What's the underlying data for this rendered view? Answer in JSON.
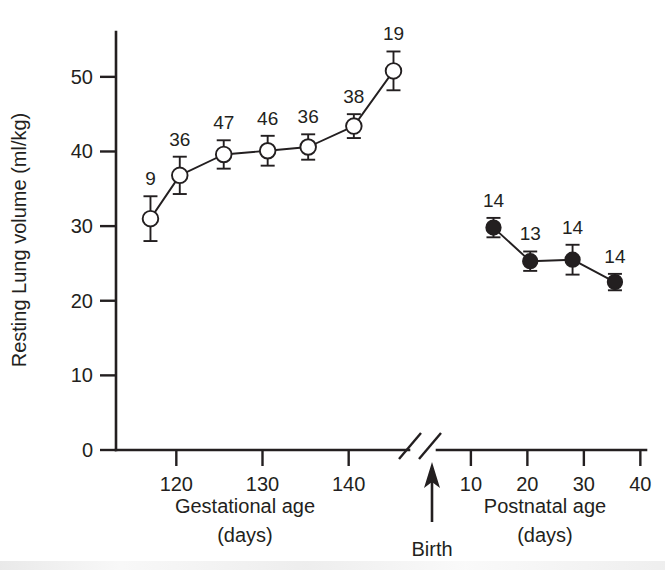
{
  "figure": {
    "title": "",
    "background_color": "#ffffff",
    "ink_color": "#231f20"
  },
  "chart_data": {
    "type": "line",
    "title": "",
    "subtitle": "",
    "ylabel": "Resting Lung volume (ml/kg)",
    "xlabel_left": "Gestational age",
    "xlabel_left_units": "(days)",
    "xlabel_right": "Postnatal age",
    "xlabel_right_units": "(days)",
    "annotation_birth": "Birth",
    "axis_break": true,
    "grid": false,
    "legend": "none",
    "ylim": [
      0,
      54
    ],
    "yticks": [
      0,
      10,
      20,
      30,
      40,
      50
    ],
    "ytick_labels": [
      "0",
      "10",
      "20",
      "30",
      "40",
      "50"
    ],
    "xticks_left": [
      120,
      130,
      140
    ],
    "xtick_labels_left": [
      "120",
      "130",
      "140"
    ],
    "xlim_left": [
      113,
      147
    ],
    "xticks_right": [
      10,
      20,
      30,
      40
    ],
    "xtick_labels_right": [
      "10",
      "20",
      "30",
      "40"
    ],
    "xlim_right": [
      4,
      41
    ],
    "series": [
      {
        "name": "Gestational (fetal)",
        "marker": "open-circle",
        "panel": "left",
        "points": [
          {
            "x": 117,
            "y": 31.0,
            "err": 3.0,
            "n": 9,
            "n_label": "9"
          },
          {
            "x": 120.4,
            "y": 36.8,
            "err": 2.5,
            "n": 36,
            "n_label": "36"
          },
          {
            "x": 125.5,
            "y": 39.6,
            "err": 1.9,
            "n": 47,
            "n_label": "47"
          },
          {
            "x": 130.6,
            "y": 40.1,
            "err": 2.0,
            "n": 46,
            "n_label": "46"
          },
          {
            "x": 135.3,
            "y": 40.6,
            "err": 1.7,
            "n": 36,
            "n_label": "36"
          },
          {
            "x": 140.6,
            "y": 43.4,
            "err": 1.6,
            "n": 38,
            "n_label": "38"
          },
          {
            "x": 145.2,
            "y": 50.8,
            "err": 2.6,
            "n": 19,
            "n_label": "19"
          }
        ]
      },
      {
        "name": "Postnatal",
        "marker": "filled-circle",
        "panel": "right",
        "points": [
          {
            "x": 14.0,
            "y": 29.8,
            "err": 1.3,
            "n": 14,
            "n_label": "14"
          },
          {
            "x": 20.5,
            "y": 25.3,
            "err": 1.3,
            "n": 13,
            "n_label": "13"
          },
          {
            "x": 28.0,
            "y": 25.5,
            "err": 2.0,
            "n": 14,
            "n_label": "14"
          },
          {
            "x": 35.5,
            "y": 22.5,
            "err": 1.1,
            "n": 14,
            "n_label": "14"
          }
        ]
      }
    ]
  }
}
